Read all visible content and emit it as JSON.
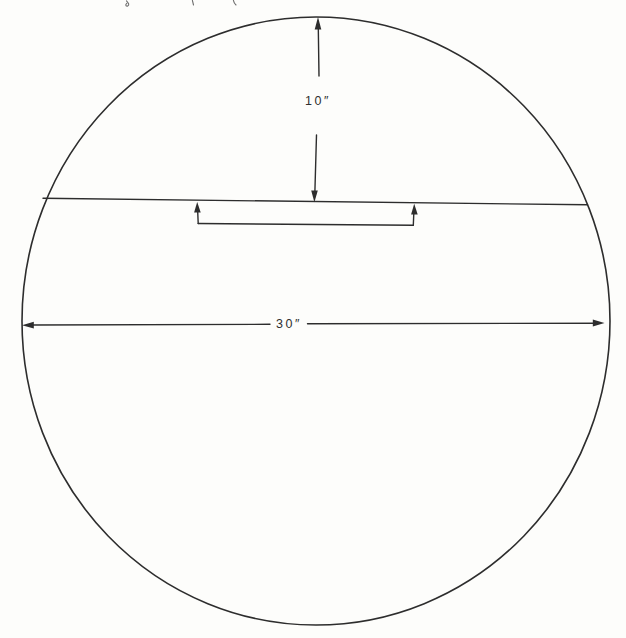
{
  "diagram": {
    "kind": "dimensioned-circle-drawing",
    "labels": {
      "top_dimension": "10″",
      "diameter_dimension": "30″"
    },
    "colors": {
      "ink": "#2d2d2d",
      "paper": "#fdfdfb",
      "faint_fragment": "#6e6e6e"
    }
  }
}
